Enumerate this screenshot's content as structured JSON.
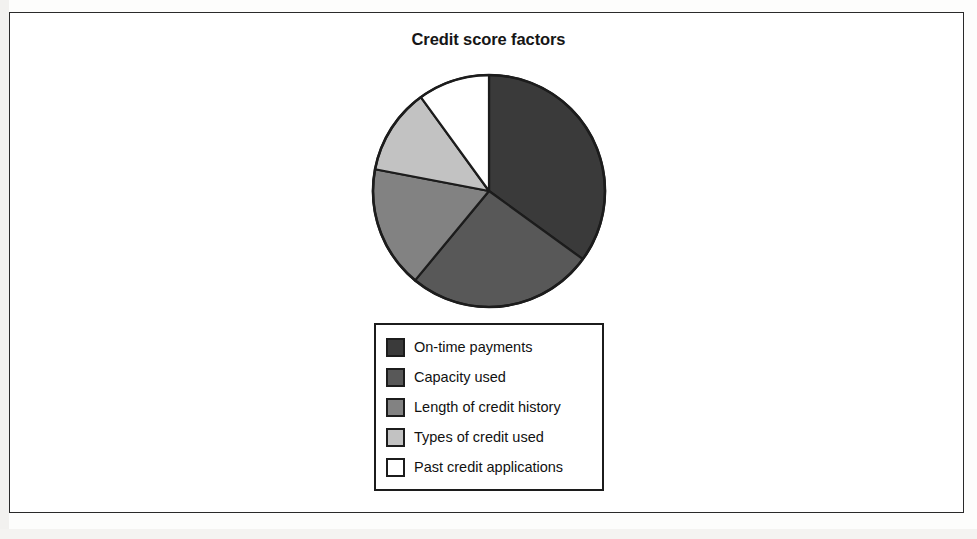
{
  "figure": {
    "title": "Credit score factors",
    "border_color": "#2a2a2a",
    "background": "#ffffff"
  },
  "chart_data": {
    "type": "pie",
    "title": "Credit score factors",
    "xlabel": "",
    "ylabel": "",
    "grid": false,
    "legend_position": "bottom",
    "start_angle_deg": 0,
    "direction": "clockwise",
    "categories": [
      "On-time payments",
      "Capacity used",
      "Length of credit history",
      "Types of credit used",
      "Past credit applications"
    ],
    "values": [
      35,
      26,
      17,
      12,
      10
    ],
    "unit": "percent",
    "slice_angles_deg": [
      126,
      93.6,
      61.2,
      43.2,
      36
    ],
    "colors": [
      "#3a3a3a",
      "#585858",
      "#828282",
      "#c2c2c2",
      "#ffffff"
    ],
    "slice_border_color": "#1c1c1c"
  },
  "legend": {
    "items": [
      {
        "label": "On-time payments",
        "color": "#3a3a3a"
      },
      {
        "label": "Capacity used",
        "color": "#585858"
      },
      {
        "label": "Length of credit history",
        "color": "#828282"
      },
      {
        "label": "Types of credit used",
        "color": "#c2c2c2"
      },
      {
        "label": "Past credit applications",
        "color": "#ffffff"
      }
    ]
  }
}
